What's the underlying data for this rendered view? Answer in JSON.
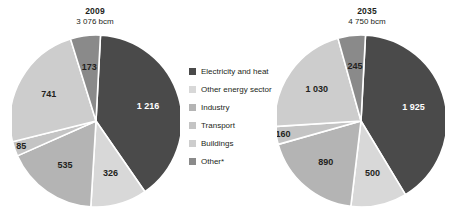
{
  "chart_data": {
    "type": "pie",
    "title": "",
    "legend_position": "center",
    "unit": "bcm",
    "categories": [
      "Electricity and heat",
      "Other energy sector",
      "Industry",
      "Transport",
      "Buildings",
      "Other*"
    ],
    "colors": [
      "#4a4a4a",
      "#d8d8d8",
      "#b4b4b4",
      "#c4c4c4",
      "#cdcdcd",
      "#8a8a8a"
    ],
    "charts": [
      {
        "title": "2009",
        "subtitle": "3 076 bcm",
        "total": 3076,
        "values": [
          1216,
          326,
          535,
          85,
          741,
          173
        ],
        "labels": [
          "1 216",
          "326",
          "535",
          "85",
          "741",
          "173"
        ]
      },
      {
        "title": "2035",
        "subtitle": "4 750 bcm",
        "total": 4750,
        "values": [
          1925,
          500,
          890,
          160,
          1030,
          245
        ],
        "labels": [
          "1 925",
          "500",
          "890",
          "160",
          "1 030",
          "245"
        ]
      }
    ]
  },
  "legend": {
    "items": [
      {
        "label": "Electricity and heat",
        "color": "#4a4a4a"
      },
      {
        "label": "Other energy sector",
        "color": "#d8d8d8"
      },
      {
        "label": "Industry",
        "color": "#b4b4b4"
      },
      {
        "label": "Transport",
        "color": "#c4c4c4"
      },
      {
        "label": "Buildings",
        "color": "#cdcdcd"
      },
      {
        "label": "Other*",
        "color": "#8a8a8a"
      }
    ]
  }
}
